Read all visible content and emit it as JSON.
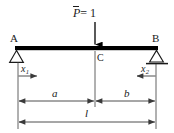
{
  "figure": {
    "type": "simply-supported-beam-diagram",
    "labels": {
      "load_symbol": "P",
      "load_equation": "= 1",
      "load_full": "P̄ = 1",
      "support_left": "A",
      "support_right": "B",
      "load_point": "C",
      "coord_left_base": "x",
      "coord_left_sub": "1",
      "coord_right_base": "x",
      "coord_right_sub": "2",
      "dim_left": "a",
      "dim_right": "b",
      "dim_total": "l"
    },
    "geometry": {
      "beam_left_x": 15,
      "beam_right_x": 158,
      "beam_y": 48,
      "beam_thickness": 4,
      "load_x": 95,
      "load_arrow_top_y": 22,
      "load_arrow_bottom_y": 46,
      "ext_left_x": 18,
      "ext_center_x": 95,
      "ext_right_x": 156,
      "dim_ab_y": 101,
      "dim_l_y": 122
    },
    "colors": {
      "beam": "#000000",
      "line": "#3a3a3a",
      "text": "#1a1a1a",
      "background": "#ffffff"
    },
    "supports": {
      "left": {
        "name": "A",
        "kind": "pin-triangle"
      },
      "right": {
        "name": "B",
        "kind": "roller-triangle-with-ground"
      }
    }
  }
}
